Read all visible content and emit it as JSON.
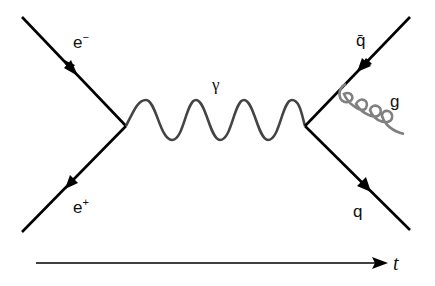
{
  "diagram": {
    "type": "feynman",
    "particles": {
      "electron": {
        "symbol": "e",
        "charge": "−"
      },
      "positron": {
        "symbol": "e",
        "charge": "+"
      },
      "photon": {
        "symbol": "γ"
      },
      "antiquark": {
        "symbol": "q̄"
      },
      "quark": {
        "symbol": "q"
      },
      "gluon": {
        "symbol": "g"
      }
    },
    "time_axis": {
      "label": "t"
    },
    "colors": {
      "fermion": "#000000",
      "photon": "#444444",
      "gluon": "#808080"
    }
  }
}
